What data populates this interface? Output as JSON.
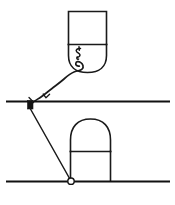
{
  "figure": {
    "title": "line-diagram",
    "background_color": "#ffffff",
    "ink_color": "#1a1a1a",
    "width": 175,
    "height": 205,
    "upper_object": {
      "name": "inverted-bullet-shape",
      "description": "rectangle with rounded lower end",
      "left": 68,
      "right": 107,
      "top": 11,
      "divider_y": 44,
      "bottom": 72,
      "inner_label": "script-mark"
    },
    "lower_object": {
      "name": "arch-shape",
      "description": "dome over rectangle",
      "left": 70,
      "right": 110,
      "apex_y": 119,
      "divider_y": 151,
      "base_y": 181
    },
    "upper_ground_line": {
      "name": "upper-horizontal-line",
      "x1": 6,
      "x2": 170,
      "y": 101
    },
    "lower_ground_line": {
      "name": "lower-horizontal-line",
      "x1": 6,
      "x2": 170,
      "y": 181
    },
    "upper_marker": {
      "name": "upper-node",
      "x": 30,
      "y": 103,
      "style": "filled-square"
    },
    "lower_marker": {
      "name": "lower-node",
      "x": 71,
      "y": 181,
      "style": "open-circle"
    },
    "wavy_connector": {
      "name": "wavy-link",
      "from": "upper-node",
      "to": "inverted-bullet-shape",
      "style": "hand-drawn-curve-with-tick"
    },
    "ray_connector": {
      "name": "diagonal-ray",
      "from": "upper-node",
      "to": "lower-node",
      "style": "straight-line"
    }
  }
}
